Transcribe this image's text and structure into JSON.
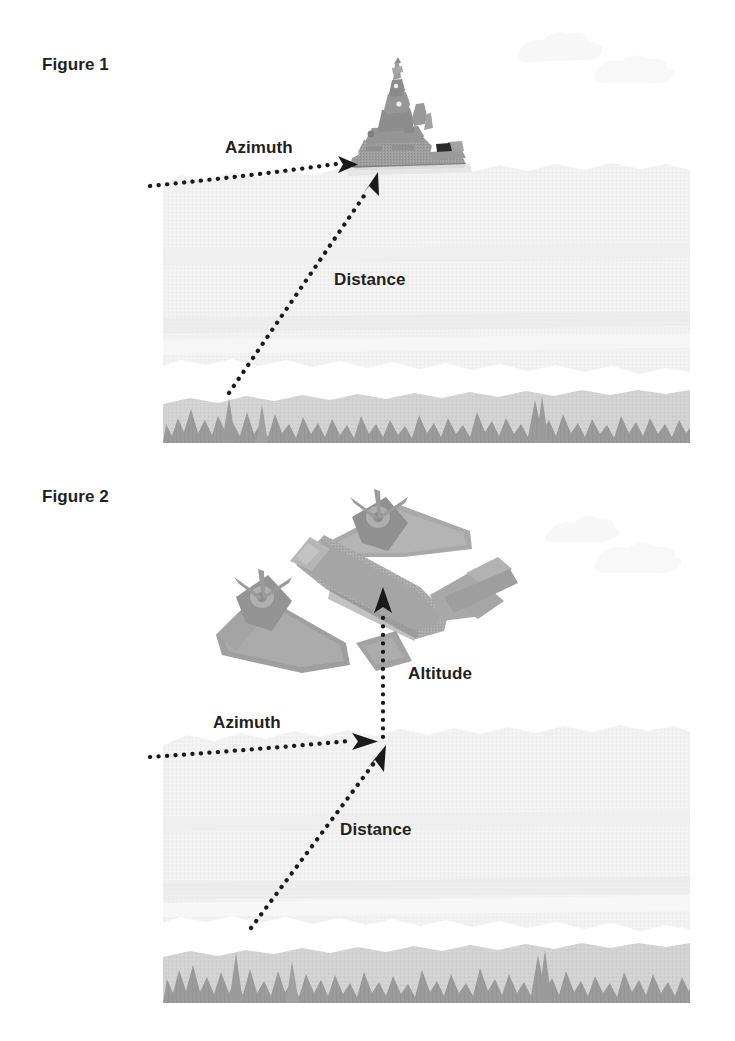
{
  "document": {
    "title": "Azimuth, Distance and Altitude measurement diagrams",
    "background_color": "#ffffff",
    "width": 735,
    "height": 1041
  },
  "palette": {
    "text": "#231f20",
    "sky_band": "#f1f1f1",
    "sky_band_shadow": "#ebebeb",
    "ground_band": "#d2d2d2",
    "grass": "#9b9b9b",
    "cloud": "#f6f6f6",
    "dot": "#1a1a1a",
    "vehicle_dark": "#8e8e8e",
    "vehicle_mid": "#a7a7a7",
    "vehicle_light": "#bdbdbd"
  },
  "figures": [
    {
      "id": "figure-1",
      "caption": "Figure 1",
      "subject": "ship-target",
      "subject_name": "battleship",
      "measurements": [
        {
          "name": "azimuth",
          "label": "Azimuth",
          "arrow": "horizontal-dotted-right"
        },
        {
          "name": "distance",
          "label": "Distance",
          "arrow": "diagonal-dotted-up-right"
        }
      ]
    },
    {
      "id": "figure-2",
      "caption": "Figure 2",
      "subject": "aircraft-target",
      "subject_name": "twin-engine-bomber",
      "measurements": [
        {
          "name": "azimuth",
          "label": "Azimuth",
          "arrow": "horizontal-dotted-right"
        },
        {
          "name": "distance",
          "label": "Distance",
          "arrow": "diagonal-dotted-up-right"
        },
        {
          "name": "altitude",
          "label": "Altitude",
          "arrow": "vertical-dotted-up"
        }
      ]
    }
  ],
  "labels": {
    "figure1_caption": "Figure 1",
    "figure2_caption": "Figure 2",
    "azimuth_1": "Azimuth",
    "distance_1": "Distance",
    "azimuth_2": "Azimuth",
    "distance_2": "Distance",
    "altitude_2": "Altitude"
  }
}
